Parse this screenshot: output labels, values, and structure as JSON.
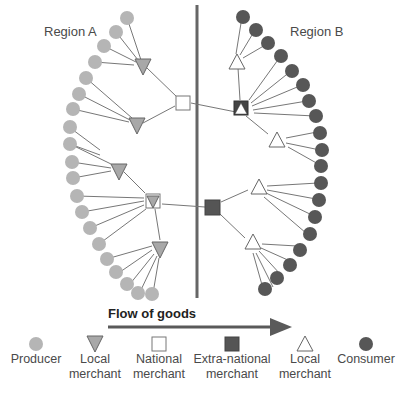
{
  "regions": {
    "a_label": "Region A",
    "b_label": "Region B"
  },
  "flow": {
    "label": "Flow of goods"
  },
  "colors": {
    "producer": "#b5b5b5",
    "local_merchant_a": "#a8a8a8",
    "extra_national": "#555555",
    "consumer": "#575757",
    "divider": "#666666",
    "line": "#777777",
    "arrow": "#5a5a5a"
  },
  "legend": [
    {
      "id": "producer",
      "label": "Producer",
      "icon": "gray-circle-icon"
    },
    {
      "id": "local-merchant-a",
      "label": "Local merchant",
      "icon": "gray-down-triangle-icon"
    },
    {
      "id": "national-merchant",
      "label": "National merchant",
      "icon": "white-square-icon"
    },
    {
      "id": "extra-national-merchant",
      "label": "Extra-national merchant",
      "icon": "dark-square-icon"
    },
    {
      "id": "local-merchant-b",
      "label": "Local merchant",
      "icon": "white-up-triangle-icon"
    },
    {
      "id": "consumer",
      "label": "Consumer",
      "icon": "dark-circle-icon"
    }
  ],
  "diagram": {
    "region_a": {
      "producers_count": 22,
      "local_merchants_count": 4,
      "national_merchants_count": 2
    },
    "region_b": {
      "consumers_count": 21,
      "local_merchants_count": 4,
      "extra_national_merchants_count": 2
    }
  }
}
